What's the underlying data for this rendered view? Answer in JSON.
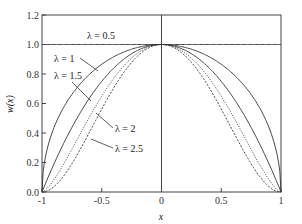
{
  "chart_data": {
    "type": "line",
    "title": "",
    "xlabel": "x",
    "ylabel": "w(x)",
    "xlim": [
      -1,
      1
    ],
    "ylim": [
      0,
      1.2
    ],
    "grid": false,
    "x_ticks": [
      "-1",
      "-0.5",
      "0",
      "0.5",
      "1"
    ],
    "y_ticks": [
      "0.0",
      "0.2",
      "0.4",
      "0.6",
      "0.8",
      "1.0",
      "1.2"
    ],
    "x": [
      -1,
      -0.75,
      -0.5,
      -0.25,
      0,
      0.25,
      0.5,
      0.75,
      1
    ],
    "series": [
      {
        "name": "λ = 0.5",
        "style": "solid",
        "values": [
          1,
          1,
          1,
          1,
          1,
          1,
          1,
          1,
          1
        ]
      },
      {
        "name": "λ = 1",
        "style": "solid",
        "values": [
          0,
          0.661,
          0.866,
          0.968,
          1,
          0.968,
          0.866,
          0.661,
          0
        ]
      },
      {
        "name": "λ = 1.5",
        "style": "solid",
        "values": [
          0,
          0.4375,
          0.75,
          0.9375,
          1,
          0.9375,
          0.75,
          0.4375,
          0
        ]
      },
      {
        "name": "λ = 2",
        "style": "dotted",
        "values": [
          0,
          0.289,
          0.65,
          0.908,
          1,
          0.908,
          0.65,
          0.289,
          0
        ]
      },
      {
        "name": "λ = 2.5",
        "style": "dashed",
        "values": [
          0,
          0.191,
          0.5625,
          0.879,
          1,
          0.879,
          0.5625,
          0.191,
          0
        ]
      }
    ],
    "annotations": [
      {
        "text": "λ = 0.5",
        "target": "λ = 0.5"
      },
      {
        "text": "λ = 1",
        "target": "λ = 1"
      },
      {
        "text": "λ = 1.5",
        "target": "λ = 1.5"
      },
      {
        "text": "λ = 2",
        "target": "λ = 2"
      },
      {
        "text": "λ = 2.5",
        "target": "λ = 2.5"
      }
    ]
  }
}
